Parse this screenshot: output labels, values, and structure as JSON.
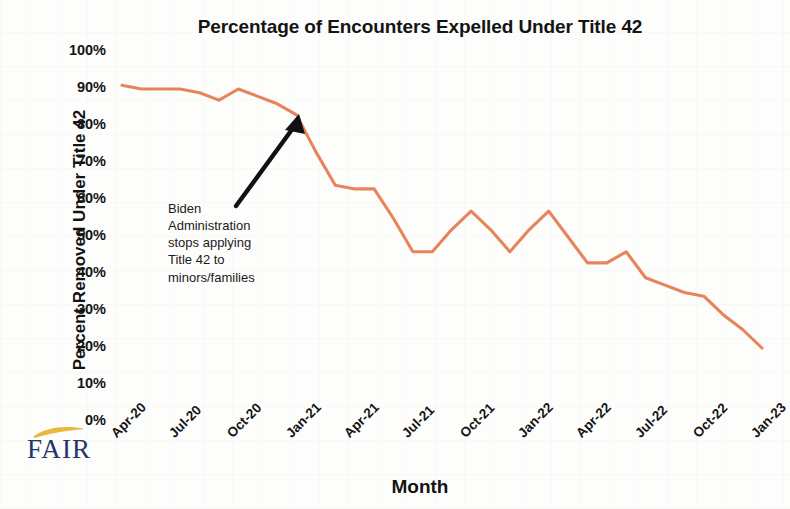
{
  "chart_data": {
    "type": "line",
    "title": "Percentage of Encounters Expelled Under Title 42",
    "xlabel": "Month",
    "ylabel": "Percent Removed Under Title 42",
    "ylim": [
      0,
      100
    ],
    "ytick_labels": [
      "100%",
      "90%",
      "80%",
      "70%",
      "60%",
      "50%",
      "40%",
      "30%",
      "20%",
      "10%",
      "0%"
    ],
    "ytick_values": [
      100,
      90,
      80,
      70,
      60,
      50,
      40,
      30,
      20,
      10,
      0
    ],
    "xtick_labels": [
      "Apr-20",
      "Jul-20",
      "Oct-20",
      "Jan-21",
      "Apr-21",
      "Jul-21",
      "Oct-21",
      "Jan-22",
      "Apr-22",
      "Jul-22",
      "Oct-22",
      "Jan-23"
    ],
    "grid": false,
    "legend": "none",
    "series_color": "#E8845C",
    "categories": [
      "Apr-20",
      "May-20",
      "Jun-20",
      "Jul-20",
      "Aug-20",
      "Sep-20",
      "Oct-20",
      "Nov-20",
      "Dec-20",
      "Jan-21",
      "Feb-21",
      "Mar-21",
      "Apr-21",
      "May-21",
      "Jun-21",
      "Jul-21",
      "Aug-21",
      "Sep-21",
      "Oct-21",
      "Nov-21",
      "Dec-21",
      "Jan-22",
      "Feb-22",
      "Mar-22",
      "Apr-22",
      "May-22",
      "Jun-22",
      "Jul-22",
      "Aug-22",
      "Sep-22",
      "Oct-22",
      "Nov-22",
      "Dec-22",
      "Jan-23"
    ],
    "values": [
      91,
      90,
      90,
      90,
      89,
      87,
      90,
      88,
      86,
      83,
      73,
      64,
      63,
      63,
      55,
      46,
      46,
      52,
      57,
      52,
      46,
      52,
      57,
      50,
      43,
      43,
      46,
      39,
      37,
      35,
      34,
      29,
      25,
      20
    ],
    "annotations": [
      {
        "text": "Biden Administration stops applying Title 42 to minors/families",
        "lines": [
          "Biden",
          "Administration",
          "stops applying",
          "Title 42 to",
          "minors/families"
        ],
        "arrow_from": "Mar-21 area, 60%",
        "arrow_to": "Jan-21, 83%"
      }
    ]
  },
  "logo": {
    "wordmark": "FAIR",
    "swoosh_color": "#E8B93C",
    "text_color": "#23356B"
  }
}
